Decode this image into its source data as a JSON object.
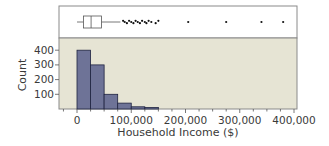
{
  "chart_data": {
    "type": "histogram_with_boxplot",
    "title": "",
    "xlabel": "Household Income ($)",
    "ylabel": "Count",
    "xlim": [
      0,
      400000
    ],
    "ylim": [
      0,
      450
    ],
    "x_ticks": [
      0,
      100000,
      200000,
      300000,
      400000
    ],
    "x_tick_labels": [
      "0",
      "100,000",
      "200,000",
      "300,000",
      "400,000"
    ],
    "y_ticks": [
      100,
      200,
      300,
      400
    ],
    "y_tick_labels": [
      "100",
      "200",
      "300",
      "400"
    ],
    "bin_width": 25000,
    "bins": [
      {
        "start": 0,
        "end": 25000,
        "count": 400
      },
      {
        "start": 25000,
        "end": 50000,
        "count": 300
      },
      {
        "start": 50000,
        "end": 75000,
        "count": 100
      },
      {
        "start": 75000,
        "end": 100000,
        "count": 40
      },
      {
        "start": 100000,
        "end": 125000,
        "count": 15
      },
      {
        "start": 125000,
        "end": 150000,
        "count": 10
      }
    ],
    "boxplot": {
      "whisker_low": 0,
      "q1": 12000,
      "median": 26000,
      "q3": 45000,
      "whisker_high": 80000,
      "outliers": [
        85000,
        88000,
        92000,
        96000,
        100000,
        104000,
        108000,
        112000,
        116000,
        120000,
        125000,
        128000,
        132000,
        137000,
        145000,
        150000,
        205000,
        275000,
        340000,
        380000
      ]
    },
    "grid": false,
    "colors": {
      "bar_fill": "#6e7397",
      "bar_stroke": "#1f2340",
      "hist_background": "#e6e4d4",
      "box_background": "#ffffff",
      "frame": "#8a8a8a"
    }
  }
}
